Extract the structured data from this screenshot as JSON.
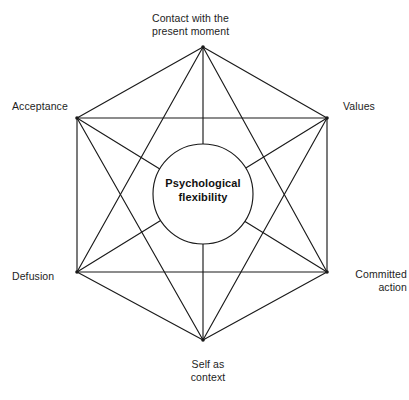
{
  "diagram": {
    "center": {
      "label": "Psychological\nflexibility"
    },
    "stroke_color": "#1a1a1a",
    "fill_color": "#ffffff",
    "background_color": "#ffffff",
    "nodes": [
      {
        "id": "contact-present-moment",
        "label": "Contact with the\npresent moment",
        "position": "top",
        "x": 203,
        "y": 47
      },
      {
        "id": "values",
        "label": "Values",
        "position": "upper-right",
        "x": 327,
        "y": 118
      },
      {
        "id": "committed-action",
        "label": "Committed\naction",
        "position": "lower-right",
        "x": 327,
        "y": 272
      },
      {
        "id": "self-as-context",
        "label": "Self as\ncontext",
        "position": "bottom",
        "x": 203,
        "y": 340
      },
      {
        "id": "defusion",
        "label": "Defusion",
        "position": "lower-left",
        "x": 77,
        "y": 272
      },
      {
        "id": "acceptance",
        "label": "Acceptance",
        "position": "upper-left",
        "x": 77,
        "y": 118
      }
    ],
    "edges": [
      [
        "contact-present-moment",
        "values"
      ],
      [
        "contact-present-moment",
        "committed-action"
      ],
      [
        "contact-present-moment",
        "self-as-context"
      ],
      [
        "contact-present-moment",
        "defusion"
      ],
      [
        "contact-present-moment",
        "acceptance"
      ],
      [
        "values",
        "committed-action"
      ],
      [
        "values",
        "self-as-context"
      ],
      [
        "values",
        "defusion"
      ],
      [
        "values",
        "acceptance"
      ],
      [
        "committed-action",
        "self-as-context"
      ],
      [
        "committed-action",
        "defusion"
      ],
      [
        "committed-action",
        "acceptance"
      ],
      [
        "self-as-context",
        "defusion"
      ],
      [
        "self-as-context",
        "acceptance"
      ],
      [
        "defusion",
        "acceptance"
      ]
    ],
    "center_circle": {
      "cx": 203,
      "cy": 194,
      "r": 50
    }
  }
}
